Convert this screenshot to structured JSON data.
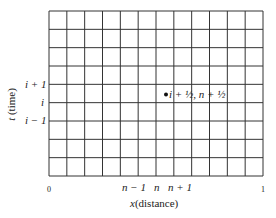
{
  "grid": {
    "columns": 12,
    "rows": 9,
    "left": 49,
    "top": 11,
    "right": 263,
    "bottom": 176,
    "line_color": "#333333"
  },
  "point": {
    "label": "i + ½, n + ½",
    "cx": 166,
    "cy": 94.5
  },
  "y_axis": {
    "title": "t (time)",
    "ticks": [
      "i + 1",
      "i",
      "i − 1"
    ]
  },
  "x_axis": {
    "title": "x (distance)",
    "start_label": "0",
    "end_label": "1",
    "ticks": [
      "n − 1",
      "n",
      "n + 1"
    ]
  }
}
